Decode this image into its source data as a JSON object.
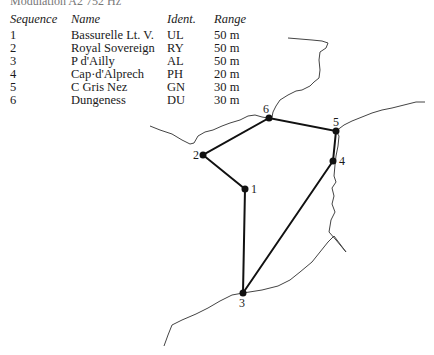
{
  "caption": "Modulation A2 752 Hz",
  "table": {
    "headers": [
      "Sequence",
      "Name",
      "Ident.",
      "Range"
    ],
    "rows": [
      {
        "seq": "1",
        "name": "Bassurelle Lt. V.",
        "ident": "UL",
        "range": "50 m"
      },
      {
        "seq": "2",
        "name": "Royal Sovereign",
        "ident": "RY",
        "range": "50 m"
      },
      {
        "seq": "3",
        "name": "P d'Ailly",
        "ident": "AL",
        "range": "50 m"
      },
      {
        "seq": "4",
        "name": "Cap·d'Alprech",
        "ident": "PH",
        "range": "20 m"
      },
      {
        "seq": "5",
        "name": "C Gris Nez",
        "ident": "GN",
        "range": "30 m"
      },
      {
        "seq": "6",
        "name": "Dungeness",
        "ident": "DU",
        "range": "30 m"
      }
    ]
  },
  "map": {
    "points": [
      {
        "label": "1",
        "x": 245,
        "y": 189
      },
      {
        "label": "2",
        "x": 203,
        "y": 155
      },
      {
        "label": "3",
        "x": 243,
        "y": 293
      },
      {
        "label": "4",
        "x": 333,
        "y": 161
      },
      {
        "label": "5",
        "x": 336,
        "y": 131
      },
      {
        "label": "6",
        "x": 269,
        "y": 118
      }
    ]
  }
}
